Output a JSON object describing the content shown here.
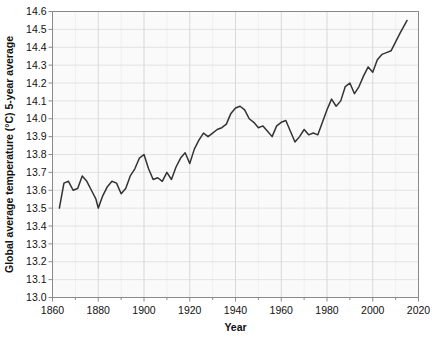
{
  "chart_data": {
    "type": "line",
    "title": "",
    "xlabel": "Year",
    "ylabel": "Global average temperature (°C) 5-year average",
    "xlim": [
      1860,
      2020
    ],
    "ylim": [
      13.0,
      14.6
    ],
    "xticks": [
      1860,
      1880,
      1900,
      1920,
      1940,
      1960,
      1980,
      2000,
      2020
    ],
    "xtick_labels": [
      "1860",
      "1880",
      "1900",
      "1920",
      "1940",
      "1960",
      "1980",
      "2000",
      "2020"
    ],
    "yticks": [
      13.0,
      13.1,
      13.2,
      13.3,
      13.4,
      13.5,
      13.6,
      13.7,
      13.8,
      13.9,
      14.0,
      14.1,
      14.2,
      14.3,
      14.4,
      14.5,
      14.6
    ],
    "ytick_labels": [
      "13.0",
      "13.1",
      "13.2",
      "13.3",
      "13.4",
      "13.5",
      "13.6",
      "13.7",
      "13.8",
      "13.9",
      "14.0",
      "14.1",
      "14.2",
      "14.3",
      "14.4",
      "14.5",
      "14.6"
    ],
    "x_minor_step": 10,
    "grid": true,
    "legend": false,
    "line_color": "#333333",
    "plot_background": "#fafafa",
    "gridline_color": "#ffffff",
    "minor_gridline_color": "#f0f0f0",
    "axis_color": "#8a8a8a",
    "series": [
      {
        "name": "Global average temperature 5-year average",
        "x": [
          1863,
          1865,
          1867,
          1869,
          1871,
          1873,
          1875,
          1877,
          1879,
          1880,
          1882,
          1884,
          1886,
          1888,
          1890,
          1892,
          1894,
          1896,
          1898,
          1900,
          1902,
          1904,
          1906,
          1908,
          1910,
          1912,
          1914,
          1916,
          1918,
          1920,
          1922,
          1924,
          1926,
          1928,
          1930,
          1932,
          1934,
          1936,
          1938,
          1940,
          1942,
          1944,
          1946,
          1948,
          1950,
          1952,
          1954,
          1956,
          1958,
          1960,
          1962,
          1964,
          1966,
          1968,
          1970,
          1972,
          1974,
          1976,
          1978,
          1980,
          1982,
          1984,
          1986,
          1988,
          1990,
          1992,
          1994,
          1996,
          1998,
          2000,
          2002,
          2004,
          2006,
          2008,
          2010,
          2012,
          2015
        ],
        "values": [
          13.5,
          13.64,
          13.65,
          13.6,
          13.61,
          13.68,
          13.65,
          13.6,
          13.55,
          13.5,
          13.57,
          13.62,
          13.65,
          13.64,
          13.58,
          13.61,
          13.68,
          13.72,
          13.78,
          13.8,
          13.72,
          13.66,
          13.67,
          13.65,
          13.7,
          13.66,
          13.73,
          13.78,
          13.81,
          13.75,
          13.83,
          13.88,
          13.92,
          13.9,
          13.92,
          13.94,
          13.95,
          13.97,
          14.03,
          14.06,
          14.07,
          14.05,
          14.0,
          13.98,
          13.95,
          13.96,
          13.93,
          13.9,
          13.96,
          13.98,
          13.99,
          13.93,
          13.87,
          13.9,
          13.94,
          13.91,
          13.92,
          13.91,
          13.98,
          14.05,
          14.11,
          14.07,
          14.1,
          14.18,
          14.2,
          14.14,
          14.18,
          14.24,
          14.29,
          14.26,
          14.33,
          14.36,
          14.37,
          14.38,
          14.43,
          14.48,
          14.55
        ]
      }
    ]
  },
  "figure": {
    "xlabel_text": "Year",
    "ylabel_text": "Global average temperature (°C) 5-year average"
  }
}
